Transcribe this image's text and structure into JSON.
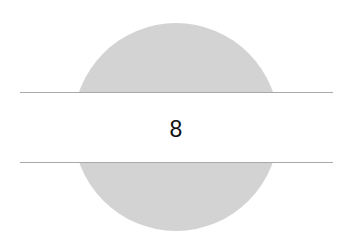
{
  "graphic": {
    "value": "8",
    "circle_color": "#d3d3d3",
    "line_color": "#a9a9a9",
    "text_color": "#111111"
  }
}
